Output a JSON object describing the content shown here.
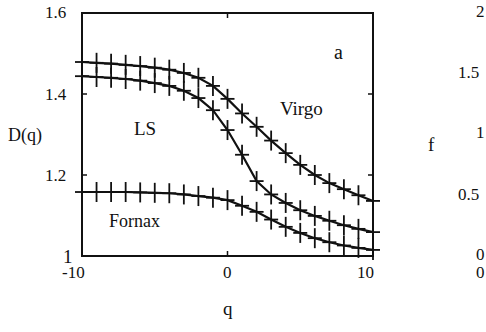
{
  "chart_data": [
    {
      "type": "line",
      "panel_label": "a",
      "title": "",
      "xlabel": "q",
      "ylabel": "D(q)",
      "xlim": [
        -10,
        10
      ],
      "ylim": [
        1,
        1.6
      ],
      "x_ticks": [
        "-10",
        "0",
        "10"
      ],
      "y_ticks": [
        "1",
        "1.2",
        "1.4",
        "1.6"
      ],
      "grid": false,
      "legend": "inline labels",
      "markers": "+",
      "x": [
        -10,
        -9,
        -8,
        -7,
        -6,
        -5,
        -4,
        -3,
        -2,
        -1,
        0,
        1,
        2,
        3,
        4,
        5,
        6,
        7,
        8,
        9,
        10
      ],
      "series": [
        {
          "name": "Virgo",
          "values": [
            1.479,
            1.477,
            1.475,
            1.472,
            1.469,
            1.465,
            1.46,
            1.452,
            1.44,
            1.42,
            1.388,
            1.352,
            1.319,
            1.285,
            1.254,
            1.225,
            1.2,
            1.18,
            1.165,
            1.15,
            1.136
          ]
        },
        {
          "name": "LS",
          "values": [
            1.444,
            1.442,
            1.44,
            1.437,
            1.433,
            1.427,
            1.42,
            1.408,
            1.39,
            1.36,
            1.311,
            1.25,
            1.185,
            1.152,
            1.131,
            1.113,
            1.099,
            1.087,
            1.076,
            1.067,
            1.059
          ]
        },
        {
          "name": "Fornax",
          "values": [
            1.158,
            1.158,
            1.158,
            1.158,
            1.157,
            1.156,
            1.155,
            1.152,
            1.148,
            1.144,
            1.138,
            1.124,
            1.109,
            1.09,
            1.072,
            1.057,
            1.044,
            1.034,
            1.026,
            1.02,
            1.015
          ]
        }
      ]
    },
    {
      "type": "line",
      "note": "partially visible right panel (cropped)",
      "ylabel": "f",
      "y_ticks": [
        "0",
        "0.5",
        "1",
        "1.5",
        "2"
      ],
      "x_ticks_visible": [
        "0"
      ],
      "series": []
    }
  ],
  "labels": {
    "panel": "a",
    "virgo": "Virgo",
    "ls": "LS",
    "fornax": "Fornax",
    "xlabel": "q",
    "ylabel": "D(q)",
    "yt_16": "1.6",
    "yt_14": "1.4",
    "yt_12": "1.2",
    "yt_1": "1",
    "xt_m10": "-10",
    "xt_0": "0",
    "xt_10": "10",
    "f_label": "f",
    "f_2": "2",
    "f_15": "1.5",
    "f_1": "1",
    "f_05": "0.5",
    "f_0": "0",
    "f_x0": "0"
  }
}
